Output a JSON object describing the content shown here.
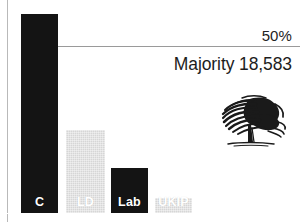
{
  "chart_data": {
    "type": "bar",
    "title": "",
    "subtitle": "",
    "xlabel": "",
    "ylabel": "",
    "categories": [
      "C",
      "LD",
      "Lab",
      "UKIP"
    ],
    "values": [
      97.5,
      41.7,
      22.5,
      7.5
    ],
    "ylim": [
      0,
      100
    ],
    "grid": false,
    "legend_position": "none",
    "series": [
      {
        "name": "Vote share",
        "values": [
          97.5,
          41.7,
          22.5,
          7.5
        ]
      }
    ],
    "bar_colors": [
      "#141414",
      "#d6d6d6",
      "#141414",
      "#d6d6d6"
    ],
    "annotations": [
      {
        "name": "threshold-line",
        "label": "50%",
        "value": 50
      },
      {
        "name": "majority-note",
        "label": "Majority 18,583"
      }
    ]
  },
  "chart": {
    "threshold": {
      "label": "50%",
      "value": 50
    },
    "majority": {
      "label": "Majority 18,583"
    },
    "bars": [
      {
        "label": "C",
        "value": 97.5,
        "style": "dark",
        "left": 21,
        "width": 37,
        "top": 14
      },
      {
        "label": "LD",
        "value": 41.7,
        "style": "light",
        "left": 66,
        "width": 39,
        "top": 130
      },
      {
        "label": "Lab",
        "value": 22.5,
        "style": "dark",
        "left": 111,
        "width": 37,
        "top": 168
      },
      {
        "label": "UKIP",
        "value": 7.5,
        "style": "light",
        "left": 155,
        "width": 37,
        "top": 198
      }
    ],
    "logo": {
      "name": "conservative-oak-tree-logo",
      "alt": "Oak tree"
    }
  },
  "colors": {
    "bar_dark": "#141414",
    "bar_light": "#d6d6d6",
    "axis": "#b9b9b9",
    "threshold_line": "#9a9a9a",
    "text": "#1d1d1d",
    "background": "#ffffff"
  }
}
